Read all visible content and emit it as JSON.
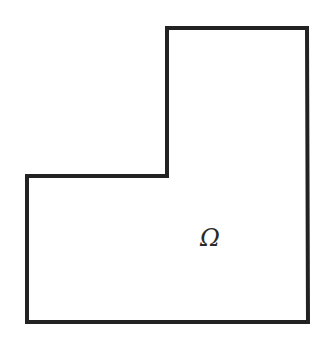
{
  "figure": {
    "shape": "L-shaped domain",
    "label": "Ω",
    "stroke_color": "#222222",
    "fill_color": "#ffffff",
    "vertices": [
      [
        167,
        28
      ],
      [
        307,
        28
      ],
      [
        308,
        322
      ],
      [
        27,
        322
      ],
      [
        27,
        176
      ],
      [
        167,
        176
      ]
    ],
    "label_position": [
      210,
      246
    ]
  }
}
